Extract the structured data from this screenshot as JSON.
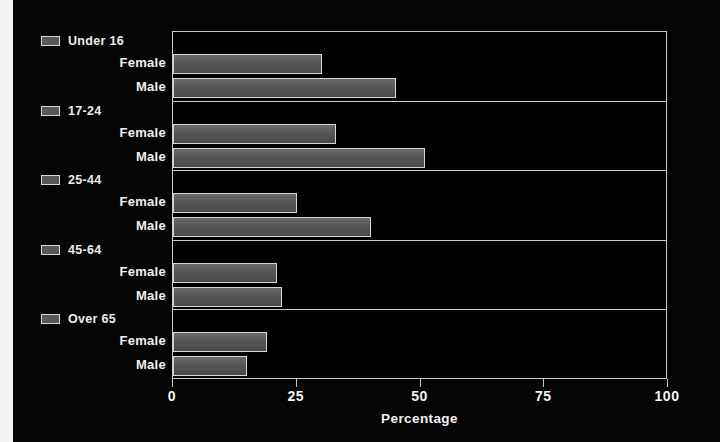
{
  "chart_data": {
    "type": "bar",
    "orientation": "horizontal",
    "title": "",
    "xlabel": "Percentage",
    "ylabel": "",
    "xlim": [
      0,
      100
    ],
    "xticks": [
      "0",
      "25",
      "50",
      "75",
      "100"
    ],
    "xtick_values": [
      0,
      25,
      50,
      75,
      100
    ],
    "grid": false,
    "legend": "none",
    "groups": [
      {
        "label": "Under 16",
        "swatch_icon": "legend-swatch-icon",
        "bars": [
          {
            "label": "Female",
            "value": 30
          },
          {
            "label": "Male",
            "value": 45
          }
        ]
      },
      {
        "label": "17-24",
        "swatch_icon": "legend-swatch-icon",
        "bars": [
          {
            "label": "Female",
            "value": 33
          },
          {
            "label": "Male",
            "value": 51
          }
        ]
      },
      {
        "label": "25-44",
        "swatch_icon": "legend-swatch-icon",
        "bars": [
          {
            "label": "Female",
            "value": 25
          },
          {
            "label": "Male",
            "value": 40
          }
        ]
      },
      {
        "label": "45-64",
        "swatch_icon": "legend-swatch-icon",
        "bars": [
          {
            "label": "Female",
            "value": 21
          },
          {
            "label": "Male",
            "value": 22
          }
        ]
      },
      {
        "label": "Over 65",
        "swatch_icon": "legend-swatch-icon",
        "bars": [
          {
            "label": "Female",
            "value": 19
          },
          {
            "label": "Male",
            "value": 15
          }
        ]
      }
    ],
    "colors": {
      "background": "#000000",
      "bar_fill": "#555555",
      "bar_border": "#d6d6d6",
      "axis": "#c9c9c9",
      "text": "#f0f0f0"
    }
  }
}
